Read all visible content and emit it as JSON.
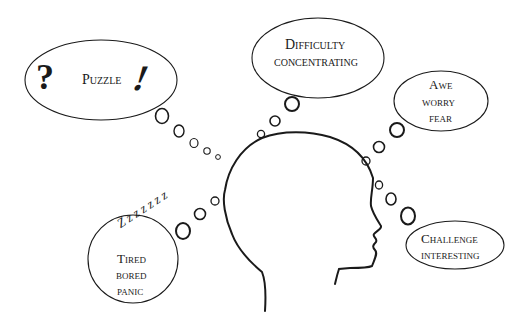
{
  "colors": {
    "stroke": "#1a1a1a",
    "background": "#ffffff"
  },
  "bubbles": {
    "puzzle": {
      "symbol_left": "?",
      "label": "Puzzle",
      "symbol_right": "!"
    },
    "difficulty": {
      "line1": "Difficulty",
      "line2": "concentrating"
    },
    "awe": {
      "line1": "Awe",
      "line2": "worry",
      "line3": "fear"
    },
    "tired": {
      "zzz": "Z z z z z z z",
      "line1": "Tired",
      "line2": "bored",
      "line3": "panic"
    },
    "challenge": {
      "line1": "Challenge",
      "line2": "interesting"
    }
  }
}
